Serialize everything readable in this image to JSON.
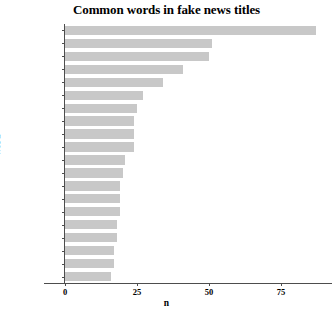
{
  "chart_data": {
    "type": "bar",
    "orientation": "horizontal",
    "title": "Common words in fake news titles",
    "xlabel": "n",
    "ylabel": "word",
    "categories": [
      "china",
      "outbreak",
      "wuhan",
      "chinese",
      "vaccine",
      "beer",
      "people",
      "patients",
      "health",
      "death",
      "world",
      "spread",
      "update",
      "sars",
      "infected",
      "news",
      "cure",
      "test",
      "due",
      "flu"
    ],
    "values": [
      87,
      51,
      50,
      41,
      34,
      27,
      25,
      24,
      24,
      24,
      21,
      20,
      19,
      19,
      19,
      18,
      18,
      17,
      17,
      16
    ],
    "xlim": [
      0,
      90
    ],
    "xticks": [
      0,
      25,
      50,
      75
    ],
    "xtick_labels": [
      "0",
      "25",
      "50",
      "75"
    ],
    "grid": false,
    "legend": null,
    "bar_color": "#c8c8c8",
    "axis_color": "#4d4d4d",
    "background": "#ffffff"
  }
}
